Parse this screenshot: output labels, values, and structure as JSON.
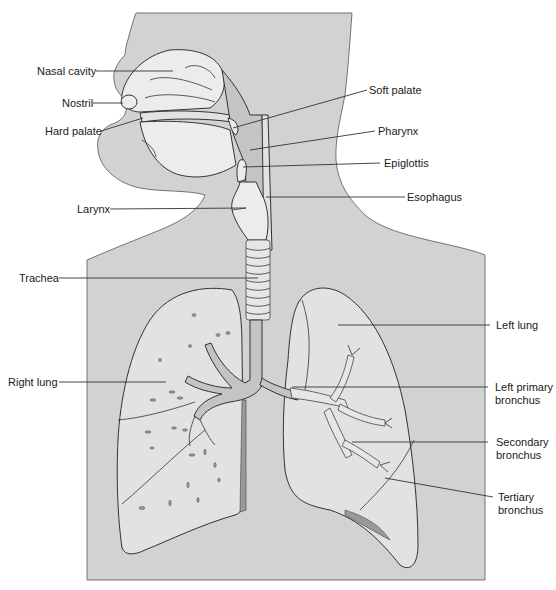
{
  "figure": {
    "labels": {
      "nasal_cavity": "Nasal cavity",
      "nostril": "Nostril",
      "hard_palate": "Hard palate",
      "soft_palate": "Soft palate",
      "pharynx": "Pharynx",
      "epiglottis": "Epiglottis",
      "esophagus": "Esophagus",
      "larynx": "Larynx",
      "trachea": "Trachea",
      "left_lung": "Left lung",
      "right_lung": "Right lung",
      "left_primary_bronchus_1": "Left primary",
      "left_primary_bronchus_2": "bronchus",
      "secondary_bronchus_1": "Secondary",
      "secondary_bronchus_2": "bronchus",
      "tertiary_bronchus_1": "Tertiary",
      "tertiary_bronchus_2": "bronchus"
    },
    "colors": {
      "body": "#d2d2d2",
      "organ": "#e2e2e2",
      "outline": "#333333",
      "background": "#ffffff"
    }
  }
}
